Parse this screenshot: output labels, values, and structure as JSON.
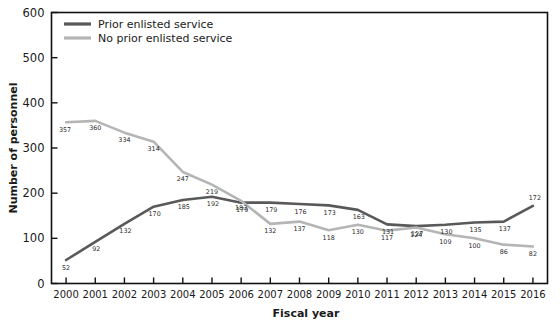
{
  "chart_data": {
    "type": "line",
    "title": "",
    "xlabel": "Fiscal year",
    "ylabel": "Number of personnel",
    "categories": [
      "2000",
      "2001",
      "2002",
      "2003",
      "2004",
      "2005",
      "2006",
      "2007",
      "2008",
      "2009",
      "2010",
      "2011",
      "2012",
      "2013",
      "2014",
      "2015",
      "2016"
    ],
    "ylim": [
      0,
      600
    ],
    "yticks": [
      "0",
      "100",
      "200",
      "300",
      "400",
      "500",
      "600"
    ],
    "grid": false,
    "legend_position": "top-left",
    "series": [
      {
        "name": "Prior enlisted service",
        "color": "#595959",
        "values": [
          52,
          92,
          132,
          170,
          185,
          192,
          179,
          179,
          176,
          173,
          163,
          131,
          127,
          130,
          135,
          137,
          172
        ]
      },
      {
        "name": "No prior enlisted service",
        "color": "#b5b5b5",
        "values": [
          357,
          360,
          334,
          314,
          247,
          219,
          183,
          132,
          137,
          118,
          130,
          117,
          124,
          109,
          100,
          86,
          82
        ]
      }
    ]
  },
  "axis_color": "#111111",
  "plot_frame_color": "#111111"
}
